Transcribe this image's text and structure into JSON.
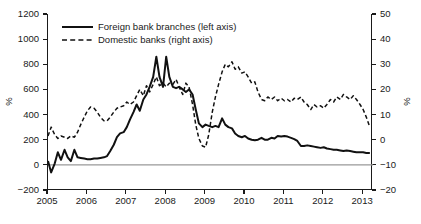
{
  "chart_data": {
    "type": "line",
    "title": "",
    "subtitle": "",
    "xlabel": "",
    "ylabel": "%",
    "ylabel_right": "%",
    "xlim": [
      2005,
      2013.25
    ],
    "ylim": [
      -200,
      1200
    ],
    "ylim_right": [
      -20,
      50
    ],
    "grid": false,
    "legend_position": "top-left",
    "x_ticks": [
      "2005",
      "2006",
      "2007",
      "2008",
      "2009",
      "2010",
      "2011",
      "2012",
      "2013"
    ],
    "x_tick_values": [
      2005,
      2006,
      2007,
      2008,
      2009,
      2010,
      2011,
      2012,
      2013
    ],
    "y_ticks_left": [
      "1200",
      "1000",
      "800",
      "600",
      "400",
      "200",
      "0",
      "-200"
    ],
    "y_tick_values_left": [
      1200,
      1000,
      800,
      600,
      400,
      200,
      0,
      -200
    ],
    "y_ticks_right": [
      "50",
      "40",
      "30",
      "20",
      "10",
      "0",
      "-10",
      "-20"
    ],
    "y_tick_values_right": [
      50,
      40,
      30,
      20,
      10,
      0,
      -10,
      -20
    ],
    "reference_line": {
      "value": 0,
      "axis": "left",
      "color": "#999999"
    },
    "series": [
      {
        "name": "Foreign bank branches (left axis)",
        "axis": "left",
        "style": "solid",
        "color": "#111111",
        "x": [
          2005.0,
          2005.08,
          2005.17,
          2005.25,
          2005.33,
          2005.42,
          2005.5,
          2005.58,
          2005.67,
          2005.75,
          2005.83,
          2005.92,
          2006.0,
          2006.08,
          2006.17,
          2006.25,
          2006.33,
          2006.42,
          2006.5,
          2006.58,
          2006.67,
          2006.75,
          2006.83,
          2006.92,
          2007.0,
          2007.08,
          2007.17,
          2007.25,
          2007.33,
          2007.42,
          2007.5,
          2007.58,
          2007.67,
          2007.75,
          2007.83,
          2007.92,
          2008.0,
          2008.08,
          2008.17,
          2008.25,
          2008.33,
          2008.42,
          2008.5,
          2008.58,
          2008.67,
          2008.75,
          2008.83,
          2008.92,
          2009.0,
          2009.08,
          2009.17,
          2009.25,
          2009.33,
          2009.42,
          2009.5,
          2009.58,
          2009.67,
          2009.75,
          2009.83,
          2009.92,
          2010.0,
          2010.08,
          2010.17,
          2010.25,
          2010.33,
          2010.42,
          2010.5,
          2010.58,
          2010.67,
          2010.75,
          2010.83,
          2010.92,
          2011.0,
          2011.08,
          2011.17,
          2011.25,
          2011.33,
          2011.42,
          2011.5,
          2011.58,
          2011.67,
          2011.75,
          2011.83,
          2011.92,
          2012.0,
          2012.08,
          2012.17,
          2012.25,
          2012.33,
          2012.42,
          2012.5,
          2012.58,
          2012.67,
          2012.75,
          2012.83,
          2012.92,
          2013.0,
          2013.08,
          2013.17
        ],
        "values": [
          30,
          -60,
          10,
          100,
          40,
          120,
          60,
          30,
          120,
          60,
          55,
          50,
          45,
          45,
          50,
          50,
          55,
          60,
          70,
          110,
          160,
          220,
          250,
          260,
          300,
          360,
          420,
          480,
          430,
          520,
          560,
          620,
          700,
          860,
          700,
          620,
          860,
          700,
          620,
          610,
          620,
          600,
          580,
          600,
          560,
          440,
          330,
          300,
          320,
          310,
          300,
          310,
          300,
          370,
          320,
          300,
          290,
          250,
          230,
          220,
          230,
          210,
          200,
          195,
          200,
          215,
          200,
          200,
          215,
          210,
          230,
          225,
          230,
          225,
          215,
          205,
          190,
          150,
          150,
          155,
          150,
          145,
          140,
          135,
          140,
          130,
          125,
          120,
          120,
          115,
          110,
          115,
          110,
          105,
          100,
          100,
          100,
          95,
          95
        ]
      },
      {
        "name": "Domestic banks (right axis)",
        "axis": "right",
        "style": "dashed",
        "color": "#111111",
        "x": [
          2005.0,
          2005.08,
          2005.17,
          2005.25,
          2005.33,
          2005.42,
          2005.5,
          2005.58,
          2005.67,
          2005.75,
          2005.83,
          2005.92,
          2006.0,
          2006.08,
          2006.17,
          2006.25,
          2006.33,
          2006.42,
          2006.5,
          2006.58,
          2006.67,
          2006.75,
          2006.83,
          2006.92,
          2007.0,
          2007.08,
          2007.17,
          2007.25,
          2007.33,
          2007.42,
          2007.5,
          2007.58,
          2007.67,
          2007.75,
          2007.83,
          2007.92,
          2008.0,
          2008.08,
          2008.17,
          2008.25,
          2008.33,
          2008.42,
          2008.5,
          2008.58,
          2008.67,
          2008.75,
          2008.83,
          2008.92,
          2009.0,
          2009.08,
          2009.17,
          2009.25,
          2009.33,
          2009.42,
          2009.5,
          2009.58,
          2009.67,
          2009.75,
          2009.83,
          2009.92,
          2010.0,
          2010.08,
          2010.17,
          2010.25,
          2010.33,
          2010.42,
          2010.5,
          2010.58,
          2010.67,
          2010.75,
          2010.83,
          2010.92,
          2011.0,
          2011.08,
          2011.17,
          2011.25,
          2011.33,
          2011.42,
          2011.5,
          2011.58,
          2011.67,
          2011.75,
          2011.83,
          2011.92,
          2012.0,
          2012.08,
          2012.17,
          2012.25,
          2012.33,
          2012.42,
          2012.5,
          2012.58,
          2012.67,
          2012.75,
          2012.83,
          2012.92,
          2013.0,
          2013.08,
          2013.17
        ],
        "values": [
          1.5,
          5.0,
          2.0,
          0.5,
          1.5,
          1.0,
          0.5,
          1.5,
          1.0,
          3.0,
          6.0,
          9.0,
          11.5,
          13.0,
          12.5,
          11.0,
          9.0,
          7.5,
          7.5,
          9.0,
          11.0,
          12.5,
          13.0,
          13.5,
          15.0,
          14.0,
          15.0,
          17.5,
          20.0,
          17.5,
          21.5,
          19.0,
          22.0,
          25.0,
          21.5,
          22.5,
          21.0,
          22.5,
          22.0,
          24.0,
          21.0,
          18.0,
          22.5,
          21.0,
          14.0,
          6.0,
          0.5,
          -2.5,
          -3.0,
          2.0,
          11.0,
          17.0,
          22.0,
          27.0,
          30.0,
          29.0,
          31.0,
          28.0,
          29.0,
          26.5,
          27.0,
          25.0,
          22.5,
          23.0,
          19.0,
          16.0,
          15.5,
          17.0,
          16.0,
          17.0,
          15.5,
          16.5,
          15.5,
          16.0,
          15.0,
          16.5,
          16.0,
          17.0,
          15.0,
          14.0,
          12.0,
          14.0,
          13.0,
          13.5,
          12.5,
          14.0,
          16.0,
          15.0,
          17.0,
          16.0,
          18.0,
          17.0,
          16.0,
          17.5,
          16.0,
          14.0,
          12.0,
          9.0,
          5.0
        ]
      }
    ]
  },
  "legend": {
    "items": [
      {
        "label": "Foreign bank branches (left axis)",
        "style": "solid"
      },
      {
        "label": "Domestic banks (right axis)",
        "style": "dashed"
      }
    ]
  },
  "axes": {
    "left_unit": "%",
    "right_unit": "%"
  }
}
